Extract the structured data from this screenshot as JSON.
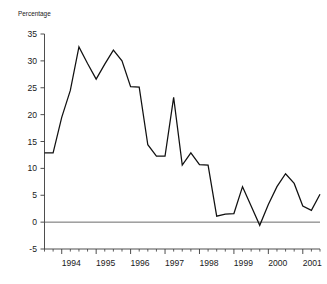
{
  "chart_data": {
    "type": "line",
    "title": "",
    "subtitle": "",
    "xlabel": "",
    "ylabel": "Percentage",
    "ylim": [
      -5,
      35
    ],
    "xlim": [
      1993.5,
      2001.5
    ],
    "yticks": [
      -5,
      0,
      5,
      10,
      15,
      20,
      25,
      30,
      35
    ],
    "ytick_labels": [
      "-5",
      "0",
      "5",
      "10",
      "15",
      "20",
      "25",
      "30",
      "35"
    ],
    "xticks": [
      1994,
      1995,
      1996,
      1997,
      1998,
      1999,
      2000,
      2001
    ],
    "xtick_labels": [
      "1994",
      "1995",
      "1996",
      "1997",
      "1998",
      "1999",
      "2000",
      "2001"
    ],
    "minor_tick_interval": 0.25,
    "grid": false,
    "legend": null,
    "zero_reference_line": true,
    "line_color": "#111111",
    "axis_color": "#3a3a3a",
    "x": [
      1993.5,
      1993.75,
      1994.0,
      1994.25,
      1994.5,
      1994.75,
      1995.0,
      1995.25,
      1995.5,
      1995.75,
      1996.0,
      1996.25,
      1996.5,
      1996.75,
      1997.0,
      1997.25,
      1997.5,
      1997.75,
      1998.0,
      1998.25,
      1998.5,
      1998.75,
      1999.0,
      1999.25,
      1999.5,
      1999.75,
      2000.0,
      2000.25,
      2000.5,
      2000.75,
      2001.0,
      2001.25,
      2001.5
    ],
    "values": [
      12.9,
      12.9,
      19.5,
      24.5,
      32.6,
      29.5,
      26.6,
      29.4,
      32.0,
      30.0,
      25.2,
      25.1,
      14.4,
      12.3,
      12.3,
      23.2,
      10.6,
      12.9,
      10.7,
      10.6,
      1.1,
      1.5,
      1.6,
      6.6,
      3.0,
      -0.6,
      3.3,
      6.6,
      9.0,
      7.2,
      3.0,
      2.2,
      5.2
    ],
    "series": [
      {
        "name": "Percentage",
        "values": [
          12.9,
          12.9,
          19.5,
          24.5,
          32.6,
          29.5,
          26.6,
          29.4,
          32.0,
          30.0,
          25.2,
          25.1,
          14.4,
          12.3,
          12.3,
          23.2,
          10.6,
          12.9,
          10.7,
          10.6,
          1.1,
          1.5,
          1.6,
          6.6,
          3.0,
          -0.6,
          3.3,
          6.6,
          9.0,
          7.2,
          3.0,
          2.2,
          5.2
        ]
      }
    ]
  },
  "figure": {
    "caption": ""
  }
}
